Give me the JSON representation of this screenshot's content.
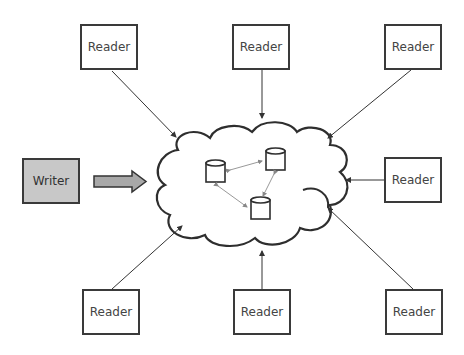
{
  "diagram": {
    "writer": {
      "label": "Writer"
    },
    "readers": [
      {
        "id": "top-left",
        "label": "Reader"
      },
      {
        "id": "top-center",
        "label": "Reader"
      },
      {
        "id": "top-right",
        "label": "Reader"
      },
      {
        "id": "right",
        "label": "Reader"
      },
      {
        "id": "bottom-left",
        "label": "Reader"
      },
      {
        "id": "bottom-center",
        "label": "Reader"
      },
      {
        "id": "bottom-right",
        "label": "Reader"
      }
    ],
    "cloud": {
      "label": "",
      "databases": 3
    },
    "colors": {
      "stroke": "#2e2e2e",
      "writer_fill": "#c8c8c8",
      "arrow_fill": "#a8a8a8",
      "link": "#999999"
    }
  }
}
